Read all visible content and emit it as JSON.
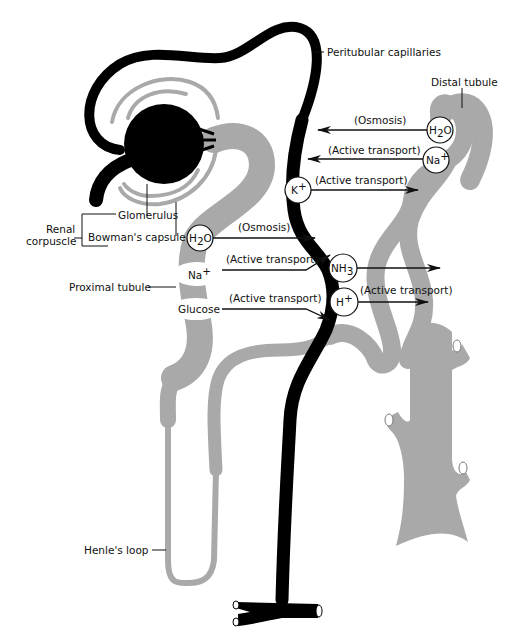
{
  "diagram": {
    "colors": {
      "tubule": "#a9a9a9",
      "capillary": "#000000",
      "background": "#ffffff",
      "text": "#111111"
    },
    "labels": {
      "peritubular_capillaries": "Peritubular capillaries",
      "distal_tubule": "Distal tubule",
      "glomerulus": "Glomerulus",
      "bowmans_capsule": "Bowman's capsule",
      "renal_corpuscle_line1": "Renal",
      "renal_corpuscle_line2": "corpuscle",
      "proximal_tubule": "Proximal tubule",
      "henles_loop": "Henle's loop"
    },
    "substances": {
      "h2o_distal": {
        "main": "H",
        "sub": "2",
        "tail": "O"
      },
      "na_distal": {
        "main": "Na",
        "sup": "+"
      },
      "k": {
        "main": "K",
        "sup": "+"
      },
      "h2o_proximal": {
        "main": "H",
        "sub": "2",
        "tail": "O"
      },
      "na_proximal": {
        "main": "Na",
        "sup": "+"
      },
      "glucose": {
        "main": "Glucose"
      },
      "nh3": {
        "main": "NH",
        "sub": "3"
      },
      "h": {
        "main": "H",
        "sup": "+"
      }
    },
    "transport": [
      {
        "id": "distal-h2o",
        "label": "(Osmosis)",
        "direction": "to-capillary"
      },
      {
        "id": "distal-na",
        "label": "(Active transport)",
        "direction": "to-capillary"
      },
      {
        "id": "k-secretion",
        "label": "(Active transport)",
        "direction": "to-tubule"
      },
      {
        "id": "proximal-h2o",
        "label": "(Osmosis)",
        "direction": "to-capillary"
      },
      {
        "id": "proximal-na",
        "label": "(Active transport)",
        "direction": "to-capillary"
      },
      {
        "id": "proximal-glucose",
        "label": "(Active transport)",
        "direction": "to-capillary"
      },
      {
        "id": "h-secretion",
        "label": "(Active transport)",
        "direction": "to-tubule"
      }
    ]
  }
}
